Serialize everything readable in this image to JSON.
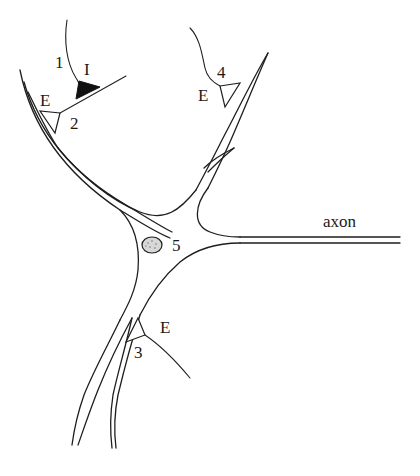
{
  "figure": {
    "labels": {
      "fiber_1": "1",
      "inhibitory": "I",
      "excitatory_2": "E",
      "synapse_2": "2",
      "excitatory_4": "E",
      "synapse_4": "4",
      "nucleus_5": "5",
      "axon": "axon",
      "excitatory_3": "E",
      "synapse_3": "3"
    },
    "colors": {
      "line": "#1e1e1e",
      "inhibitory_fill": "#111111",
      "nucleus_fill": "#d8d8d8",
      "background": "#ffffff"
    }
  }
}
